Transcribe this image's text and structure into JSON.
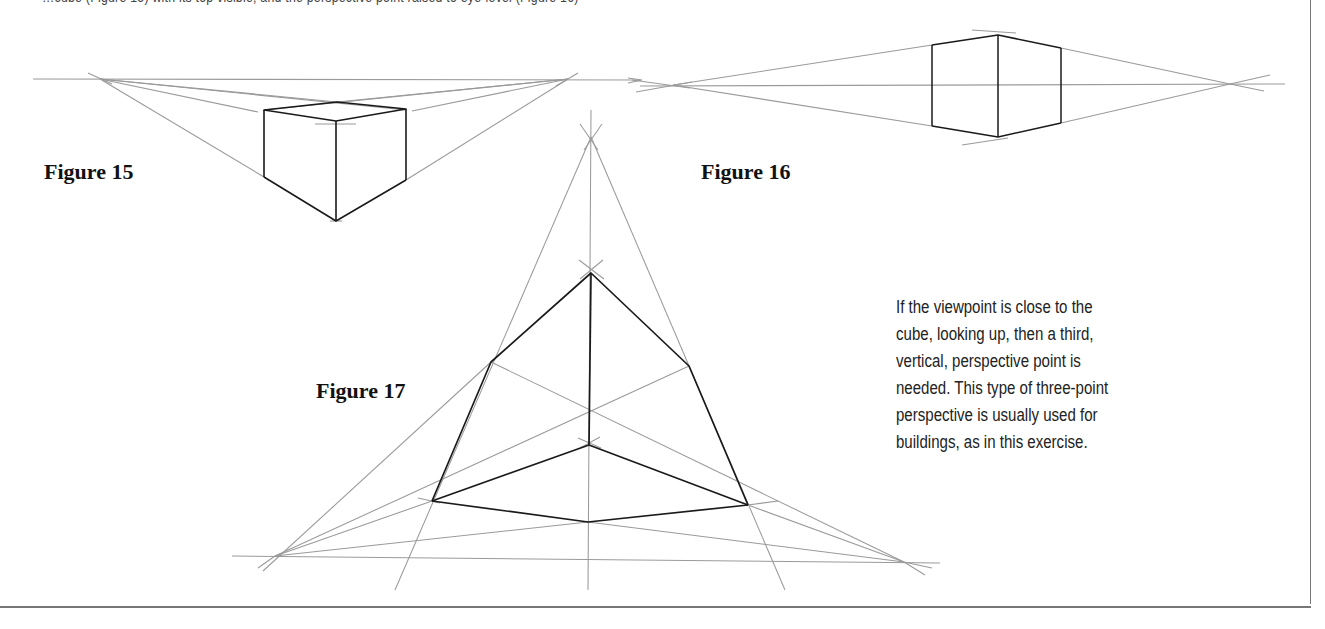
{
  "page": {
    "clipped_caption": "…cube (Figure 15) with its top visible, and the perspective point raised to eye-level (Figure 16)",
    "colors": {
      "construction_line": "#9a9a9a",
      "cube_edge": "#1a1a1a",
      "frame": "#777777",
      "text": "#222222"
    }
  },
  "figures": [
    {
      "id": "figure-15",
      "label": "Figure 15",
      "description": "Two-point perspective cube viewed from above, horizon line with two vanishing points"
    },
    {
      "id": "figure-16",
      "label": "Figure 16",
      "description": "Two-point perspective cube at eye level, horizon passing through cube center"
    },
    {
      "id": "figure-17",
      "label": "Figure 17",
      "description": "Three-point perspective cube looking up with a vertical vanishing point"
    }
  ],
  "body_text": {
    "lines": [
      "If the viewpoint is close to the",
      "cube, looking up, then a third,",
      "vertical, perspective point is",
      "needed. This type of three-point",
      "perspective is usually used for",
      "buildings, as in this exercise."
    ]
  }
}
